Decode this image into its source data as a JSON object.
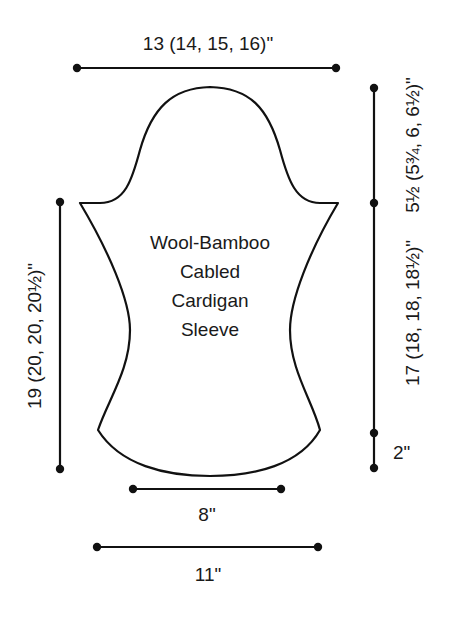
{
  "diagram": {
    "title_lines": [
      "Wool-Bamboo",
      "Cabled",
      "Cardigan",
      "Sleeve"
    ],
    "dimensions": {
      "top_width": "13 (14, 15, 16)\"",
      "cap_height": "5½ (5¾, 6, 6½)\"",
      "sleeve_length": "17 (18, 18, 18½)\"",
      "cuff_height": "2\"",
      "total_length": "19 (20, 20, 20½)\"",
      "waist_width": "8\"",
      "bottom_width": "11\""
    },
    "colors": {
      "line": "#111111",
      "text": "#1a1a1a",
      "background": "#ffffff"
    }
  }
}
